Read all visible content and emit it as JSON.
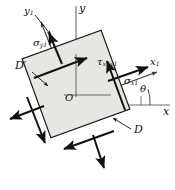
{
  "figure": {
    "type": "stress-element-diagram",
    "colors": {
      "element_fill": "#e6e6e3",
      "element_stroke": "#1a1a1a",
      "axis": "#555555",
      "arrow": "#111111",
      "leader": "#111111",
      "background": "#ffffff"
    },
    "element": {
      "rotation_deg": -20,
      "center": {
        "x": 76,
        "y": 84
      },
      "half_size": 42
    }
  },
  "labels": {
    "axis_y": "y",
    "axis_x": "x",
    "axis_y1_base": "y",
    "axis_y1_sub": "1",
    "axis_x1_base": "x",
    "axis_x1_sub": "1",
    "angle_theta": "θ",
    "origin": "O",
    "corner_d": "D",
    "corner_d_prime": "D′",
    "sigma_y1_base": "σ",
    "sigma_y1_sub": "y",
    "sigma_y1_sub2": "1",
    "sigma_x1_base": "σ",
    "sigma_x1_sub": "x",
    "sigma_x1_sub2": "1",
    "tau_base": "τ",
    "tau_sub": "x",
    "tau_sub2": "1",
    "tau_sub3": "y",
    "tau_sub4": "1"
  }
}
